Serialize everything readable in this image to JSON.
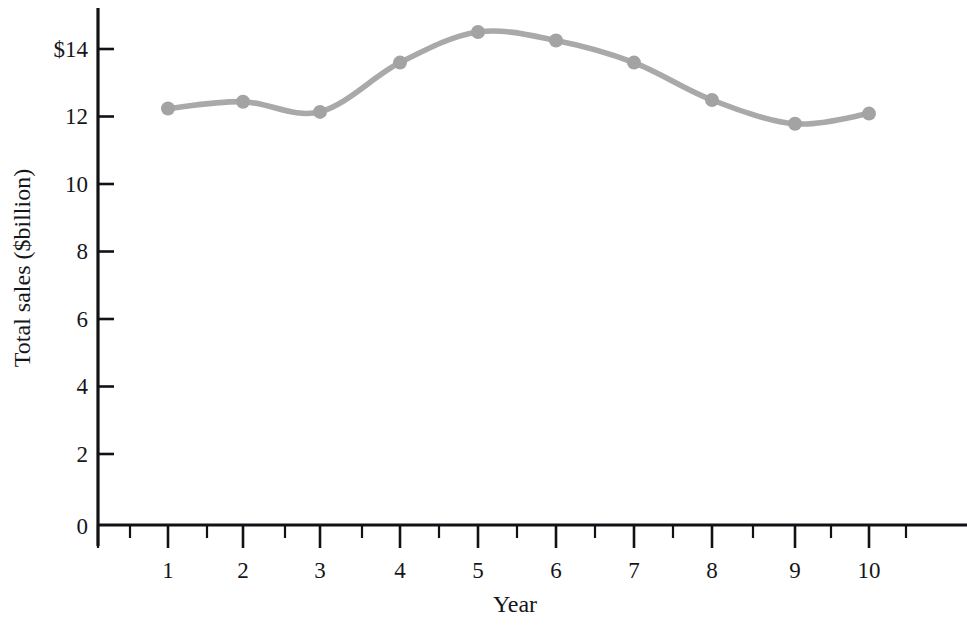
{
  "chart_data": {
    "type": "line",
    "title": "",
    "xlabel": "Year",
    "ylabel": "Total sales ($billion)",
    "categories": [
      "1",
      "2",
      "3",
      "4",
      "5",
      "6",
      "7",
      "8",
      "9",
      "10"
    ],
    "x": [
      1,
      2,
      3,
      4,
      5,
      6,
      7,
      8,
      9,
      10
    ],
    "values": [
      12.25,
      12.45,
      12.15,
      13.6,
      14.5,
      14.25,
      13.6,
      12.5,
      11.8,
      12.1
    ],
    "series": [
      {
        "name": "Total sales",
        "values": [
          12.25,
          12.45,
          12.15,
          13.6,
          14.5,
          14.25,
          13.6,
          12.5,
          11.8,
          12.1
        ]
      }
    ],
    "xlim": [
      0,
      10.8
    ],
    "ylim": [
      0,
      15.1
    ],
    "x_ticks": [
      1,
      2,
      3,
      4,
      5,
      6,
      7,
      8,
      9,
      10
    ],
    "x_tick_labels": [
      "1",
      "2",
      "3",
      "4",
      "5",
      "6",
      "7",
      "8",
      "9",
      "10"
    ],
    "x_minor_ticks": [
      0.5,
      1.5,
      2.5,
      3.5,
      4.5,
      5.5,
      6.5,
      7.5,
      8.5,
      9.5,
      10.5
    ],
    "y_ticks": [
      0,
      2,
      4,
      6,
      8,
      10,
      12,
      14
    ],
    "y_tick_labels": [
      "0",
      "2",
      "4",
      "6",
      "8",
      "10",
      "12",
      "$14"
    ],
    "grid": false,
    "legend": "none",
    "line_color": "#a9a9a9",
    "marker_color": "#a3a3a3",
    "axis_color": "#111216",
    "background_color": "#ffffff",
    "marker_style": "circle",
    "line_style": "smooth"
  }
}
